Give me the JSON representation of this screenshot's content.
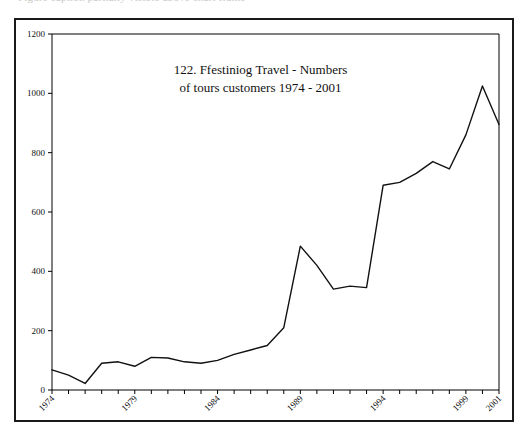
{
  "page": {
    "cut_off_header_text": "Figure caption partially visible above chart frame"
  },
  "chart_data": {
    "type": "line",
    "title_line1": "122. Ffestiniog Travel - Numbers",
    "title_line2": "of tours customers 1974 - 2001",
    "xlabel": "",
    "ylabel": "",
    "grid": false,
    "legend": "none",
    "ylim": [
      0,
      1200
    ],
    "ytick_labels": [
      "0",
      "200",
      "400",
      "600",
      "800",
      "1000",
      "1200"
    ],
    "ytick_values": [
      0,
      200,
      400,
      600,
      800,
      1000,
      1200
    ],
    "xlim": [
      1974,
      2001
    ],
    "xtick_labels": [
      "1974",
      "1979",
      "1984",
      "1989",
      "1994",
      "1999",
      "2001"
    ],
    "xtick_values": [
      1974,
      1979,
      1984,
      1989,
      1994,
      1999,
      2001
    ],
    "xtick_rotation": 45,
    "x": [
      1974,
      1975,
      1976,
      1977,
      1978,
      1979,
      1980,
      1981,
      1982,
      1983,
      1984,
      1985,
      1986,
      1987,
      1988,
      1989,
      1990,
      1991,
      1992,
      1993,
      1994,
      1995,
      1996,
      1997,
      1998,
      1999,
      2000,
      2001
    ],
    "values": [
      68,
      50,
      22,
      90,
      95,
      80,
      110,
      108,
      95,
      90,
      100,
      120,
      135,
      150,
      210,
      485,
      420,
      340,
      350,
      345,
      690,
      700,
      730,
      770,
      745,
      860,
      1025,
      895
    ],
    "line_color": "#111111",
    "series": [
      {
        "name": "Tours customers",
        "values": [
          68,
          50,
          22,
          90,
          95,
          80,
          110,
          108,
          95,
          90,
          100,
          120,
          135,
          150,
          210,
          485,
          420,
          340,
          350,
          345,
          690,
          700,
          730,
          770,
          745,
          860,
          1025,
          895
        ]
      }
    ]
  }
}
